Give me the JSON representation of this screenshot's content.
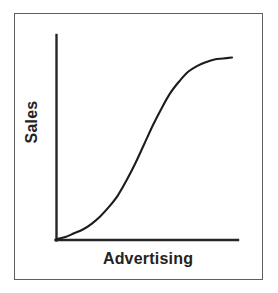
{
  "figure": {
    "background_color": "#ffffff",
    "frame_color": "#5f5f5f",
    "axis_color": "#262626",
    "curve_color": "#1c1c1c"
  },
  "chart_data": {
    "type": "line",
    "title": "",
    "subtitle": "",
    "xlabel": "Advertising",
    "ylabel": "Sales",
    "grid": false,
    "legend": false,
    "legend_position": "none",
    "axis_style": "open-L (left and bottom spines only, no ticks, no tick labels)",
    "xticks": [],
    "yticks": [],
    "xticklabels": [],
    "yticklabels": [],
    "xlim": [
      0,
      1
    ],
    "ylim": [
      0,
      1
    ],
    "annotations": [],
    "series": [
      {
        "name": "Sales response to Advertising",
        "shape": "sigmoid (S-shaped response curve)",
        "x": [
          0.0,
          0.05,
          0.1,
          0.15,
          0.2,
          0.25,
          0.3,
          0.35,
          0.4,
          0.45,
          0.5,
          0.55,
          0.6,
          0.65,
          0.7,
          0.75,
          0.8,
          0.85,
          0.9,
          0.95,
          1.0
        ],
        "y": [
          0.0,
          0.01,
          0.03,
          0.05,
          0.08,
          0.12,
          0.17,
          0.23,
          0.31,
          0.4,
          0.5,
          0.6,
          0.69,
          0.77,
          0.83,
          0.88,
          0.91,
          0.93,
          0.945,
          0.95,
          0.955
        ]
      }
    ]
  }
}
